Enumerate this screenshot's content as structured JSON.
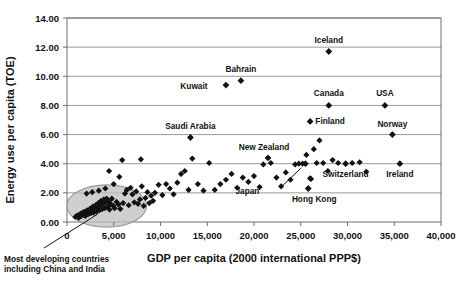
{
  "chart_data": {
    "type": "scatter",
    "title": "",
    "xlabel": "GDP per capita (2000 international PPP$)",
    "ylabel": "Energy use per capita (TOE)",
    "xlim": [
      0,
      40000
    ],
    "ylim": [
      0,
      14
    ],
    "xticks": [
      0,
      5000,
      10000,
      15000,
      20000,
      25000,
      30000,
      35000,
      40000
    ],
    "xtick_labels": [
      "0",
      "5,000",
      "10,000",
      "15,000",
      "20,000",
      "25,000",
      "30,000",
      "35,000",
      "40,000"
    ],
    "yticks": [
      0,
      2,
      4,
      6,
      8,
      10,
      12,
      14
    ],
    "ytick_labels": [
      "0.00",
      "2.00",
      "4.00",
      "6.00",
      "8.00",
      "10.00",
      "12.00",
      "14.00"
    ],
    "grid": "horizontal",
    "legend": "none",
    "marker": "diamond",
    "marker_color": "#111111",
    "labeled_points": [
      {
        "name": "Iceland",
        "x": 28000,
        "y": 11.7,
        "label_dx": 0,
        "label_dy": -9
      },
      {
        "name": "Bahrain",
        "x": 18600,
        "y": 9.7,
        "label_dx": 0,
        "label_dy": -9
      },
      {
        "name": "Kuwait",
        "x": 17000,
        "y": 9.4,
        "label_dx": -32,
        "label_dy": 4
      },
      {
        "name": "Canada",
        "x": 28000,
        "y": 8.0,
        "label_dx": 0,
        "label_dy": -9
      },
      {
        "name": "USA",
        "x": 34000,
        "y": 8.0,
        "label_dx": 0,
        "label_dy": -9
      },
      {
        "name": "Finland",
        "x": 26000,
        "y": 6.9,
        "label_dx": 20,
        "label_dy": 3
      },
      {
        "name": "Norway",
        "x": 34800,
        "y": 6.0,
        "label_dx": 0,
        "label_dy": -8
      },
      {
        "name": "Saudi Arabia",
        "x": 13200,
        "y": 5.8,
        "label_dx": 0,
        "label_dy": -8
      },
      {
        "name": "New Zealand",
        "x": 21500,
        "y": 4.4,
        "label_dx": -4,
        "label_dy": -8
      },
      {
        "name": "Switzerland",
        "x": 29800,
        "y": 4.0,
        "label_dx": 0,
        "label_dy": 13
      },
      {
        "name": "Ireland",
        "x": 35600,
        "y": 4.0,
        "label_dx": 0,
        "label_dy": 13
      },
      {
        "name": "Hong Kong",
        "x": 25800,
        "y": 2.3,
        "label_dx": 6,
        "label_dy": 14
      },
      {
        "name": "Japan",
        "x": 25500,
        "y": 4.0,
        "label_dx": -58,
        "label_dy": 30,
        "leader": true
      }
    ],
    "points": [
      [
        900,
        0.35
      ],
      [
        1100,
        0.45
      ],
      [
        1250,
        0.3
      ],
      [
        1400,
        0.55
      ],
      [
        1500,
        0.4
      ],
      [
        1600,
        0.62
      ],
      [
        1750,
        0.5
      ],
      [
        1850,
        0.7
      ],
      [
        1950,
        0.42
      ],
      [
        2050,
        0.58
      ],
      [
        2150,
        0.8
      ],
      [
        2250,
        0.52
      ],
      [
        2350,
        0.68
      ],
      [
        2450,
        0.9
      ],
      [
        2550,
        0.6
      ],
      [
        2650,
        0.75
      ],
      [
        2750,
        1.05
      ],
      [
        2850,
        0.65
      ],
      [
        2950,
        0.85
      ],
      [
        3050,
        1.15
      ],
      [
        3150,
        0.72
      ],
      [
        3250,
        0.95
      ],
      [
        3350,
        1.3
      ],
      [
        3450,
        0.8
      ],
      [
        3550,
        1.1
      ],
      [
        3650,
        1.45
      ],
      [
        3750,
        0.88
      ],
      [
        3850,
        1.22
      ],
      [
        3950,
        1.55
      ],
      [
        4050,
        0.95
      ],
      [
        4150,
        1.35
      ],
      [
        4250,
        1.6
      ],
      [
        4350,
        1.05
      ],
      [
        4450,
        1.42
      ],
      [
        4550,
        0.85
      ],
      [
        4650,
        1.25
      ],
      [
        4800,
        1.6
      ],
      [
        4950,
        1.1
      ],
      [
        5100,
        0.95
      ],
      [
        5300,
        1.38
      ],
      [
        5500,
        1.2
      ],
      [
        5700,
        0.9
      ],
      [
        2100,
        1.95
      ],
      [
        2700,
        2.05
      ],
      [
        3400,
        2.15
      ],
      [
        4100,
        2.3
      ],
      [
        4500,
        3.5
      ],
      [
        5000,
        2.6
      ],
      [
        5600,
        3.1
      ],
      [
        6000,
        1.3
      ],
      [
        6200,
        1.95
      ],
      [
        6400,
        2.2
      ],
      [
        6600,
        1.15
      ],
      [
        6800,
        2.35
      ],
      [
        7000,
        1.9
      ],
      [
        7200,
        1.35
      ],
      [
        7400,
        2.1
      ],
      [
        7600,
        1.25
      ],
      [
        7800,
        1.55
      ],
      [
        8000,
        2.45
      ],
      [
        8200,
        1.1
      ],
      [
        8400,
        1.65
      ],
      [
        8600,
        2.05
      ],
      [
        8800,
        1.3
      ],
      [
        9000,
        1.8
      ],
      [
        9200,
        1.45
      ],
      [
        5900,
        4.25
      ],
      [
        7900,
        4.3
      ],
      [
        9400,
        2.0
      ],
      [
        9800,
        2.55
      ],
      [
        10200,
        1.85
      ],
      [
        10600,
        2.6
      ],
      [
        11000,
        2.3
      ],
      [
        11400,
        1.9
      ],
      [
        11800,
        2.7
      ],
      [
        12200,
        3.3
      ],
      [
        12600,
        3.5
      ],
      [
        13000,
        2.2
      ],
      [
        13400,
        4.35
      ],
      [
        14000,
        2.6
      ],
      [
        14600,
        2.15
      ],
      [
        15200,
        4.05
      ],
      [
        15800,
        2.2
      ],
      [
        16400,
        2.6
      ],
      [
        17000,
        2.9
      ],
      [
        17600,
        3.3
      ],
      [
        18200,
        2.35
      ],
      [
        18800,
        3.05
      ],
      [
        19400,
        2.75
      ],
      [
        20000,
        3.15
      ],
      [
        20600,
        2.4
      ],
      [
        21000,
        3.95
      ],
      [
        21800,
        4.05
      ],
      [
        22400,
        3.05
      ],
      [
        22900,
        2.45
      ],
      [
        23400,
        3.4
      ],
      [
        23900,
        2.9
      ],
      [
        24400,
        3.95
      ],
      [
        24800,
        4.0
      ],
      [
        25200,
        4.0
      ],
      [
        25600,
        4.6
      ],
      [
        26000,
        3.0
      ],
      [
        26400,
        5.0
      ],
      [
        26700,
        4.05
      ],
      [
        27000,
        5.6
      ],
      [
        27400,
        4.05
      ],
      [
        27900,
        3.5
      ],
      [
        28400,
        4.25
      ],
      [
        29000,
        4.05
      ],
      [
        30500,
        4.05
      ],
      [
        31300,
        4.1
      ],
      [
        32000,
        3.45
      ],
      [
        26100,
        2.95
      ]
    ],
    "ellipse": {
      "cx": 4250,
      "cy": 1.1,
      "rx": 4250,
      "ry": 1.45,
      "fill": "#bfbfbf",
      "stroke": "#9a9a9a",
      "opacity": 0.75
    },
    "callout": {
      "line1": "Most developing countries",
      "line2": "including China and India",
      "target_x": 3300,
      "target_y": 0.55
    },
    "colors": {
      "marker": "#111111",
      "gridline": "#8f8f8f",
      "axis": "#6f6f6f",
      "background": "#ffffff",
      "ellipse_fill": "#bfbfbf"
    }
  }
}
